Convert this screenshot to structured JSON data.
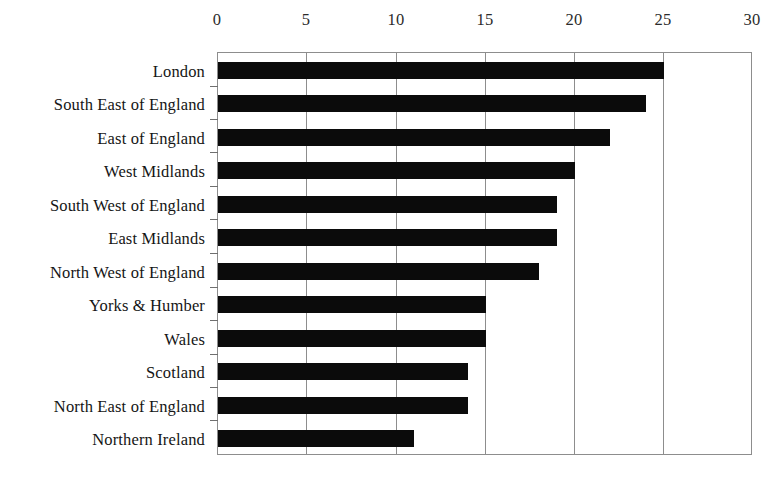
{
  "chart_data": {
    "type": "bar",
    "orientation": "horizontal",
    "title": "",
    "subtitle": "",
    "xlabel": "",
    "ylabel": "",
    "xlim": [
      0,
      30
    ],
    "ylim": null,
    "grid": true,
    "legend": null,
    "legend_position": "none",
    "xticks": [
      0,
      5,
      10,
      15,
      20,
      25,
      30
    ],
    "xtick_labels": [
      "0",
      "5",
      "10",
      "15",
      "20",
      "25",
      "30"
    ],
    "categories": [
      "London",
      "South East of England",
      "East of England",
      "West Midlands",
      "South West of England",
      "East Midlands",
      "North West of England",
      "Yorks & Humber",
      "Wales",
      "Scotland",
      "North East of England",
      "Northern Ireland"
    ],
    "values": [
      25,
      24,
      22,
      20,
      19,
      19,
      18,
      15,
      15,
      14,
      14,
      11
    ],
    "bar_color": "#0b0b0b",
    "axis_color": "#8d8d8d"
  }
}
